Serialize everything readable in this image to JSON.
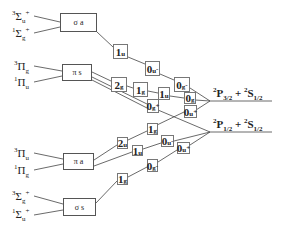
{
  "diagram": {
    "type": "correlation-diagram",
    "molecular_terms": [
      {
        "id": "t1",
        "mult": "3",
        "symbol": "Σ",
        "sub": "u",
        "sup": "+"
      },
      {
        "id": "t2",
        "mult": "1",
        "symbol": "Σ",
        "sub": "g",
        "sup": "+"
      },
      {
        "id": "t3",
        "mult": "3",
        "symbol": "Π",
        "sub": "g",
        "sup": ""
      },
      {
        "id": "t4",
        "mult": "1",
        "symbol": "Π",
        "sub": "u",
        "sup": ""
      },
      {
        "id": "t5",
        "mult": "3",
        "symbol": "Π",
        "sub": "u",
        "sup": ""
      },
      {
        "id": "t6",
        "mult": "1",
        "symbol": "Π",
        "sub": "g",
        "sup": ""
      },
      {
        "id": "t7",
        "mult": "3",
        "symbol": "Σ",
        "sub": "g",
        "sup": "+"
      },
      {
        "id": "t8",
        "mult": "1",
        "symbol": "Σ",
        "sub": "u",
        "sup": "+"
      }
    ],
    "orbital_boxes": [
      {
        "id": "b1",
        "label": "σ a"
      },
      {
        "id": "b2",
        "label": "π s"
      },
      {
        "id": "b3",
        "label": "π a"
      },
      {
        "id": "b4",
        "label": "σ s"
      }
    ],
    "omega_states": [
      {
        "id": "s1",
        "num": "1",
        "sub": "u",
        "sup": ""
      },
      {
        "id": "s2",
        "num": "0",
        "sub": "u",
        "sup": "-"
      },
      {
        "id": "s3",
        "num": "0",
        "sub": "g",
        "sup": "-"
      },
      {
        "id": "s4",
        "num": "2",
        "sub": "g",
        "sup": ""
      },
      {
        "id": "s5",
        "num": "1",
        "sub": "g",
        "sup": ""
      },
      {
        "id": "s6",
        "num": "1",
        "sub": "u",
        "sup": ""
      },
      {
        "id": "s7",
        "num": "0",
        "sub": "g",
        "sup": "+"
      },
      {
        "id": "s8",
        "num": "0",
        "sub": "g",
        "sup": ""
      },
      {
        "id": "s9",
        "num": "0",
        "sub": "u",
        "sup": "+"
      },
      {
        "id": "s10",
        "num": "1",
        "sub": "g",
        "sup": ""
      },
      {
        "id": "s11",
        "num": "2",
        "sub": "u",
        "sup": ""
      },
      {
        "id": "s12",
        "num": "1",
        "sub": "u",
        "sup": ""
      },
      {
        "id": "s13",
        "num": "0",
        "sub": "u",
        "sup": "-"
      },
      {
        "id": "s14",
        "num": "0",
        "sub": "u",
        "sup": "+"
      },
      {
        "id": "s15",
        "num": "0",
        "sub": "g",
        "sup": "-"
      },
      {
        "id": "s16",
        "num": "1",
        "sub": "g",
        "sup": ""
      }
    ],
    "asymptotes": [
      {
        "id": "a1",
        "p_sup": "2",
        "p": "P",
        "p_sub": "3/2",
        "plus": " + ",
        "s_sup": "2",
        "s": "S",
        "s_sub": "1/2"
      },
      {
        "id": "a2",
        "p_sup": "2",
        "p": "P",
        "p_sub": "1/2",
        "plus": " + ",
        "s_sup": "2",
        "s": "S",
        "s_sub": "1/2"
      }
    ]
  }
}
